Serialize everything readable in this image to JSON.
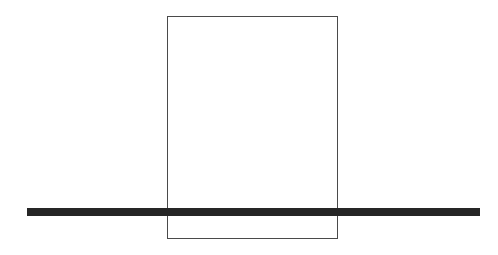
{
  "canvas": {
    "width": 498,
    "height": 255,
    "background": "#ffffff"
  },
  "shapes": [
    {
      "id": "rectangle",
      "kind": "rectangle-outline",
      "x": 167,
      "y": 16,
      "width": 171,
      "height": 223,
      "stroke": "#4a4a4a",
      "stroke_width": 1,
      "fill": "none"
    },
    {
      "id": "horizontal-bar",
      "kind": "filled-rectangle",
      "x": 27,
      "y": 208,
      "width": 453,
      "height": 8,
      "fill": "#262626"
    }
  ]
}
